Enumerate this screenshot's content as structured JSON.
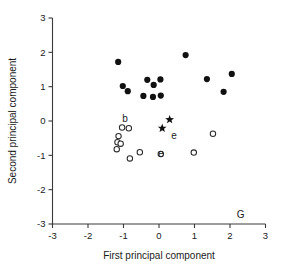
{
  "chart_data": {
    "type": "scatter",
    "title": "",
    "xlabel": "First principal component",
    "ylabel": "Second principal component",
    "xlim": [
      -3,
      3
    ],
    "ylim": [
      -3,
      3
    ],
    "xticks": [
      "-3",
      "-2",
      "-1",
      "0",
      "1",
      "2",
      "3"
    ],
    "yticks": [
      "-3",
      "-2",
      "-1",
      "0",
      "1",
      "2",
      "3"
    ],
    "xtick_values": [
      -3,
      -2,
      -1,
      0,
      1,
      2,
      3
    ],
    "ytick_values": [
      -3,
      -2,
      -1,
      0,
      1,
      2,
      3
    ],
    "grid": false,
    "legend": null,
    "series": [
      {
        "name": "filled-circle-group",
        "marker": "filled-circle",
        "color": "#111111",
        "points": [
          {
            "x": -1.15,
            "y": 1.72
          },
          {
            "x": -1.02,
            "y": 1.02
          },
          {
            "x": -0.88,
            "y": 0.87
          },
          {
            "x": -0.44,
            "y": 0.73
          },
          {
            "x": -0.33,
            "y": 1.2
          },
          {
            "x": -0.15,
            "y": 1.05
          },
          {
            "x": -0.17,
            "y": 0.7
          },
          {
            "x": 0.04,
            "y": 1.21
          },
          {
            "x": 0.05,
            "y": 0.74
          },
          {
            "x": 0.75,
            "y": 1.92
          },
          {
            "x": 1.35,
            "y": 1.22
          },
          {
            "x": 1.82,
            "y": 0.85
          },
          {
            "x": 2.05,
            "y": 1.37
          }
        ]
      },
      {
        "name": "open-circle-group",
        "marker": "open-circle",
        "color": "#2b2b2b",
        "points": [
          {
            "x": -1.04,
            "y": -0.19
          },
          {
            "x": -0.85,
            "y": -0.21
          },
          {
            "x": -1.14,
            "y": -0.44
          },
          {
            "x": -1.17,
            "y": -0.62
          },
          {
            "x": -1.08,
            "y": -0.66
          },
          {
            "x": -1.19,
            "y": -0.82
          },
          {
            "x": -0.82,
            "y": -1.09
          },
          {
            "x": -0.54,
            "y": -0.91
          },
          {
            "x": 0.05,
            "y": -0.96
          },
          {
            "x": 0.98,
            "y": -0.92
          },
          {
            "x": 1.52,
            "y": -0.37
          }
        ]
      },
      {
        "name": "star-group",
        "marker": "star",
        "color": "#111111",
        "points": [
          {
            "x": 0.09,
            "y": -0.21
          },
          {
            "x": 0.3,
            "y": 0.04
          }
        ]
      }
    ],
    "annotations": [
      {
        "text": "b",
        "x": -0.96,
        "y": 0.08
      },
      {
        "text": "e",
        "x": 0.42,
        "y": -0.42
      },
      {
        "text": "e",
        "x": 0.06,
        "y": -0.94
      },
      {
        "text": "G",
        "x": 2.3,
        "y": -2.72
      }
    ]
  }
}
